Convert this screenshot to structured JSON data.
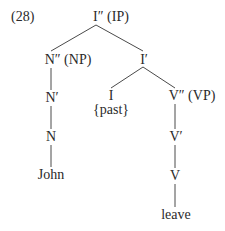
{
  "example_number": "(28)",
  "tree": {
    "root": {
      "label": "I″ (IP)"
    },
    "np": {
      "label": "N″ (NP)"
    },
    "n_bar": {
      "label": "N′"
    },
    "n": {
      "label": "N"
    },
    "n_word": {
      "label": "John"
    },
    "i_bar": {
      "label": "I′"
    },
    "i": {
      "label": "I"
    },
    "i_feature": {
      "label": "{past}"
    },
    "vp": {
      "label": "V″ (VP)"
    },
    "v_bar": {
      "label": "V′"
    },
    "v": {
      "label": "V"
    },
    "v_word": {
      "label": "leave"
    }
  },
  "colors": {
    "line": "#4a4a4a",
    "text": "#2a2a2a"
  }
}
